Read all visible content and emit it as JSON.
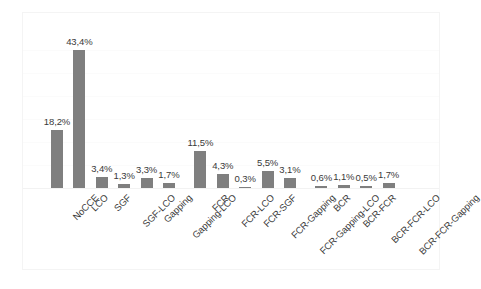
{
  "chart_data": {
    "type": "bar",
    "title": "",
    "subtitle": "",
    "xlabel": "",
    "ylabel": "",
    "grid": true,
    "legend": "none",
    "axis_visible": false,
    "y_tick_labels": [],
    "ylim": [
      0,
      46
    ],
    "bar_color": "#7f7f7f",
    "value_suffix": "%",
    "decimal_separator": ",",
    "categories": [
      "NoCCE",
      "LCO",
      "SGF",
      "SGF-LCO",
      "Gapping",
      "Gapping-LCO",
      "FCR",
      "FCR-LCO",
      "FCR-SGF",
      "FCR-Gapping",
      "FCR-Gapping-LCO",
      "BCR",
      "BCR-FCR",
      "BCR-FCR-LCO",
      "BCR-FCR-Gapping"
    ],
    "values": [
      18.2,
      43.4,
      3.4,
      1.3,
      3.3,
      1.7,
      11.5,
      4.3,
      0.3,
      5.5,
      3.1,
      0.6,
      1.1,
      0.5,
      1.7
    ],
    "value_labels": [
      "18,2%",
      "43,4%",
      "3,4%",
      "1,3%",
      "3,3%",
      "1,7%",
      "11,5%",
      "4,3%",
      "0,3%",
      "5,5%",
      "3,1%",
      "0,6%",
      "1,1%",
      "0,5%",
      "1,7%"
    ],
    "group_breaks": [
      6,
      11
    ]
  }
}
